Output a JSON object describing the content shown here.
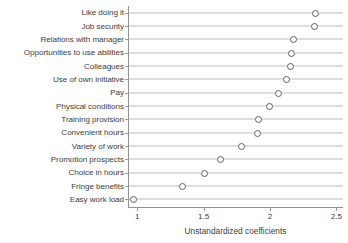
{
  "chart_data": {
    "type": "scatter",
    "title": "",
    "xlabel": "Unstandardized coefficients",
    "ylabel": "",
    "xlim": [
      0.93,
      2.55
    ],
    "xticks": [
      1,
      1.5,
      2,
      2.5
    ],
    "xticklabels": [
      "1",
      "1.5",
      "2",
      "2.5"
    ],
    "grid": false,
    "legend": null,
    "orientation": "horizontal",
    "marker": "open-circle",
    "categories": [
      "Like doing it",
      "Job security",
      "Relations with manager",
      "Opportunities to use abilities",
      "Colleagues",
      "Use of own initiative",
      "Pay",
      "Physical conditions",
      "Training provision",
      "Convenient hours",
      "Variety of work",
      "Promotion prospects",
      "Choice in hours",
      "Fringe benefits",
      "Easy work load"
    ],
    "values": [
      2.34,
      2.33,
      2.17,
      2.16,
      2.15,
      2.12,
      2.06,
      1.99,
      1.91,
      1.9,
      1.78,
      1.62,
      1.5,
      1.34,
      0.97
    ]
  },
  "colors": {
    "marker_stroke": "#5a5f63",
    "line": "#b9bcbe",
    "axis": "#8e9295",
    "text": "#3d3d3d",
    "background": "#ffffff"
  }
}
